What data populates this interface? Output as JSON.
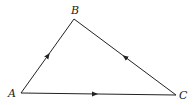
{
  "diagram": {
    "type": "directed-triangle",
    "vertices": [
      {
        "id": "A",
        "label": "A",
        "x": 21,
        "y": 93
      },
      {
        "id": "B",
        "label": "B",
        "x": 74,
        "y": 19
      },
      {
        "id": "C",
        "label": "C",
        "x": 176,
        "y": 95
      }
    ],
    "edges": [
      {
        "from": "A",
        "to": "B",
        "arrow": "midpoint"
      },
      {
        "from": "C",
        "to": "B",
        "arrow": "midpoint"
      },
      {
        "from": "A",
        "to": "C",
        "arrow": "midpoint"
      }
    ],
    "colors": {
      "stroke": "#222222",
      "background": "#ffffff"
    }
  }
}
